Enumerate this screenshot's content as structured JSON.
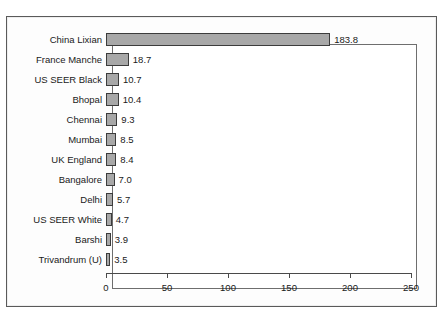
{
  "chart_data": {
    "type": "bar",
    "orientation": "horizontal",
    "title": "",
    "xlabel": "",
    "ylabel": "",
    "xlim": [
      0,
      250
    ],
    "xticks": [
      0,
      50,
      100,
      150,
      200,
      250
    ],
    "grid": false,
    "legend": null,
    "categories": [
      "China Lixian",
      "France Manche",
      "US SEER Black",
      "Bhopal",
      "Chennai",
      "Mumbai",
      "UK England",
      "Bangalore",
      "Delhi",
      "US SEER White",
      "Barshi",
      "Trivandrum (U)"
    ],
    "values": [
      183.8,
      18.7,
      10.7,
      10.4,
      9.3,
      8.5,
      8.4,
      7.0,
      5.7,
      4.7,
      3.9,
      3.5
    ],
    "value_labels": [
      "183.8",
      "18.7",
      "10.7",
      "10.4",
      "9.3",
      "8.5",
      "8.4",
      "7.0",
      "5.7",
      "4.7",
      "3.9",
      "3.5"
    ],
    "colors": {
      "bar_fill": "#a8a8a8",
      "bar_border": "#3c3c3c",
      "plot_background": "#ffffff",
      "frame_background": "#fdfdfd",
      "frame_border": "#5a5a5a",
      "axis": "#4a4a4a",
      "text": "#1a1a1a"
    }
  }
}
